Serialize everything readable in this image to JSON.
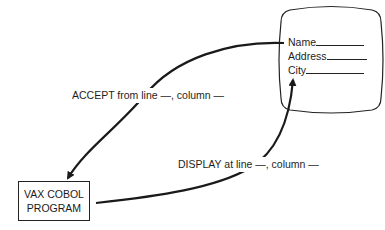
{
  "diagram": {
    "screen": {
      "fields": [
        {
          "label": "Name"
        },
        {
          "label": "Address"
        },
        {
          "label": "City"
        }
      ]
    },
    "program_box": {
      "line1": "VAX COBOL",
      "line2": "PROGRAM"
    },
    "arrows": {
      "accept_label": "ACCEPT from line —, column —",
      "display_label": "DISPLAY at line —, column —"
    },
    "colors": {
      "ink": "#1a1a1a",
      "background": "#ffffff"
    }
  }
}
